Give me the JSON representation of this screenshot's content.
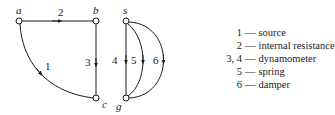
{
  "diagram": {
    "type": "linear-graph",
    "graphs": [
      {
        "name": "left-graph",
        "nodes": [
          {
            "id": "a",
            "label": "a"
          },
          {
            "id": "b",
            "label": "b"
          },
          {
            "id": "c",
            "label": "c"
          }
        ],
        "edges": [
          {
            "id": "2",
            "label": "2",
            "from": "a",
            "to": "b",
            "shape": "straight"
          },
          {
            "id": "3",
            "label": "3",
            "from": "b",
            "to": "c",
            "shape": "straight"
          },
          {
            "id": "1",
            "label": "1",
            "from": "a",
            "to": "c",
            "shape": "arc"
          }
        ]
      },
      {
        "name": "right-graph",
        "nodes": [
          {
            "id": "s",
            "label": "s"
          },
          {
            "id": "g",
            "label": "g"
          }
        ],
        "edges": [
          {
            "id": "4",
            "label": "4",
            "from": "s",
            "to": "g",
            "shape": "straight"
          },
          {
            "id": "5",
            "label": "5",
            "from": "s",
            "to": "g",
            "shape": "arc"
          },
          {
            "id": "6",
            "label": "6",
            "from": "s",
            "to": "g",
            "shape": "arc"
          }
        ]
      }
    ]
  },
  "legend": {
    "dash": "—",
    "items": [
      {
        "key": "1",
        "text": "source"
      },
      {
        "key": "2",
        "text": "internal resistance"
      },
      {
        "key": "3, 4",
        "text": "dynamometer"
      },
      {
        "key": "5",
        "text": "spring"
      },
      {
        "key": "6",
        "text": "damper"
      }
    ]
  },
  "colors": {
    "stroke": "#1a1a1a",
    "background": "#ffffff"
  }
}
